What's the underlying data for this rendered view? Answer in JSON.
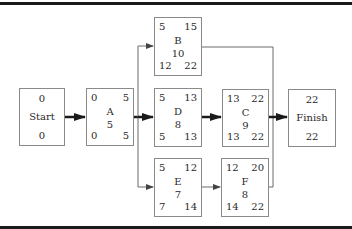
{
  "diagram": {
    "type": "activity-on-node network (critical path)",
    "nodes": {
      "start": {
        "label": "Start",
        "top_value": "0",
        "bottom_value": "0"
      },
      "A": {
        "name": "A",
        "duration": "5",
        "es": "0",
        "ef": "5",
        "ls": "0",
        "lf": "5"
      },
      "B": {
        "name": "B",
        "duration": "10",
        "es": "5",
        "ef": "15",
        "ls": "12",
        "lf": "22"
      },
      "D": {
        "name": "D",
        "duration": "8",
        "es": "5",
        "ef": "13",
        "ls": "5",
        "lf": "13"
      },
      "E": {
        "name": "E",
        "duration": "7",
        "es": "5",
        "ef": "12",
        "ls": "7",
        "lf": "14"
      },
      "C": {
        "name": "C",
        "duration": "9",
        "es": "13",
        "ef": "22",
        "ls": "13",
        "lf": "22"
      },
      "F": {
        "name": "F",
        "duration": "8",
        "es": "12",
        "ef": "20",
        "ls": "14",
        "lf": "22"
      },
      "finish": {
        "label": "Finish",
        "top_value": "22",
        "bottom_value": "22"
      }
    },
    "edges": [
      {
        "from": "Start",
        "to": "A",
        "critical": true
      },
      {
        "from": "A",
        "to": "B",
        "critical": false
      },
      {
        "from": "A",
        "to": "D",
        "critical": true
      },
      {
        "from": "A",
        "to": "E",
        "critical": false
      },
      {
        "from": "D",
        "to": "C",
        "critical": true
      },
      {
        "from": "E",
        "to": "F",
        "critical": false
      },
      {
        "from": "B",
        "to": "Finish",
        "critical": false
      },
      {
        "from": "C",
        "to": "Finish",
        "critical": true
      },
      {
        "from": "F",
        "to": "Finish",
        "critical": false
      }
    ],
    "colors": {
      "box_border": "#8a8a8a",
      "thin_edge": "#6a6a6a",
      "critical_edge": "#1a1a1a",
      "rule": "#1a1a1a"
    }
  }
}
